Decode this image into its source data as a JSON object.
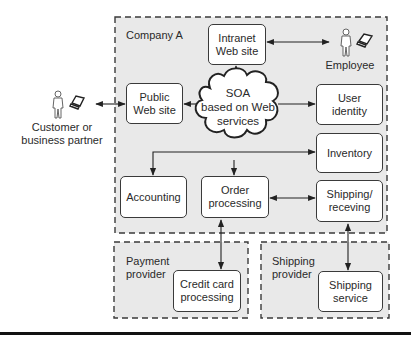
{
  "diagram": {
    "regions": [
      {
        "id": "company-a",
        "label": "Company A"
      },
      {
        "id": "payment-provider",
        "label": "Payment\nprovider"
      },
      {
        "id": "shipping-provider",
        "label": "Shipping\nprovider"
      }
    ],
    "hub": {
      "label": "SOA\nbased on Web\nservices",
      "shape": "cloud"
    },
    "nodes": {
      "intranet": "Intranet\nWeb site",
      "public_web": "Public\nWeb site",
      "user_identity": "User\nidentity",
      "inventory": "Inventory",
      "accounting": "Accounting",
      "order_processing": "Order\nprocessing",
      "shipping_receiving": "Shipping/\nreceving",
      "credit_card": "Credit card\nprocessing",
      "shipping_service": "Shipping\nservice"
    },
    "actors": {
      "customer": {
        "label": "Customer or\nbusiness partner",
        "icon": "person-with-laptop-icon"
      },
      "employee": {
        "label": "Employee",
        "icon": "person-with-laptop-icon"
      }
    },
    "edges": [
      {
        "from": "customer",
        "to": "public_web",
        "type": "bidirectional"
      },
      {
        "from": "intranet",
        "to": "employee",
        "type": "bidirectional"
      },
      {
        "from": "hub",
        "to": "intranet",
        "type": "directed"
      },
      {
        "from": "hub",
        "to": "public_web",
        "type": "directed"
      },
      {
        "from": "hub",
        "to": "user_identity",
        "type": "directed"
      },
      {
        "from": "hub",
        "to": "inventory",
        "type": "directed"
      },
      {
        "from": "hub",
        "to": "accounting",
        "type": "directed"
      },
      {
        "from": "hub",
        "to": "order_processing",
        "type": "directed"
      },
      {
        "from": "order_processing",
        "to": "shipping_receiving",
        "type": "bidirectional"
      },
      {
        "from": "order_processing",
        "to": "credit_card",
        "type": "bidirectional"
      },
      {
        "from": "shipping_receiving",
        "to": "shipping_service",
        "type": "bidirectional"
      }
    ],
    "colors": {
      "region_fill": "#e9e9e9",
      "stroke": "#3a3a3a",
      "box_fill": "#ffffff"
    }
  }
}
